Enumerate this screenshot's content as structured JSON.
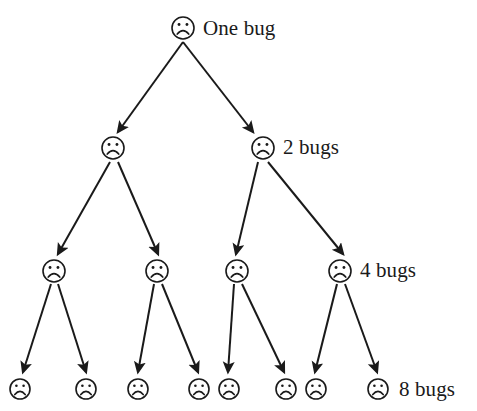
{
  "diagram": {
    "node_icon": "sad-face-icon",
    "icon_colors": {
      "stroke": "#1a1a1a",
      "fill": "#ffffff"
    },
    "arrow_color": "#1a1a1a",
    "background": "#ffffff",
    "levels": [
      {
        "index": 0,
        "label": "One bug",
        "count": 1,
        "label_x": 203,
        "label_y": 18,
        "node_y": 28,
        "node_radius": 11,
        "nodes_x": [
          183
        ]
      },
      {
        "index": 1,
        "label": "2 bugs",
        "count": 2,
        "label_x": 283,
        "label_y": 137,
        "node_y": 148,
        "node_radius": 11,
        "nodes_x": [
          113,
          263
        ]
      },
      {
        "index": 2,
        "label": "4 bugs",
        "count": 4,
        "label_x": 360,
        "label_y": 260,
        "node_y": 271,
        "node_radius": 11,
        "nodes_x": [
          54,
          157,
          237,
          340
        ]
      },
      {
        "index": 3,
        "label": "8 bugs",
        "count": 8,
        "label_x": 399,
        "label_y": 379,
        "node_y": 389,
        "node_radius": 10,
        "nodes_x": [
          20,
          86,
          138,
          199,
          229,
          286,
          316,
          378
        ]
      }
    ],
    "edges": [
      {
        "from_level": 0,
        "from": 183,
        "from_y": 42,
        "to": 118,
        "to_y": 132
      },
      {
        "from_level": 0,
        "from": 183,
        "from_y": 42,
        "to": 253,
        "to_y": 132
      },
      {
        "from_level": 1,
        "from": 110,
        "from_y": 162,
        "to": 58,
        "to_y": 254
      },
      {
        "from_level": 1,
        "from": 118,
        "from_y": 162,
        "to": 158,
        "to_y": 254
      },
      {
        "from_level": 1,
        "from": 258,
        "from_y": 162,
        "to": 236,
        "to_y": 254
      },
      {
        "from_level": 1,
        "from": 268,
        "from_y": 162,
        "to": 343,
        "to_y": 254
      },
      {
        "from_level": 2,
        "from": 51,
        "from_y": 284,
        "to": 23,
        "to_y": 372
      },
      {
        "from_level": 2,
        "from": 58,
        "from_y": 284,
        "to": 86,
        "to_y": 372
      },
      {
        "from_level": 2,
        "from": 154,
        "from_y": 284,
        "to": 138,
        "to_y": 372
      },
      {
        "from_level": 2,
        "from": 162,
        "from_y": 284,
        "to": 198,
        "to_y": 372
      },
      {
        "from_level": 2,
        "from": 234,
        "from_y": 284,
        "to": 228,
        "to_y": 372
      },
      {
        "from_level": 2,
        "from": 242,
        "from_y": 284,
        "to": 284,
        "to_y": 372
      },
      {
        "from_level": 2,
        "from": 337,
        "from_y": 284,
        "to": 315,
        "to_y": 372
      },
      {
        "from_level": 2,
        "from": 345,
        "from_y": 284,
        "to": 377,
        "to_y": 372
      }
    ]
  }
}
